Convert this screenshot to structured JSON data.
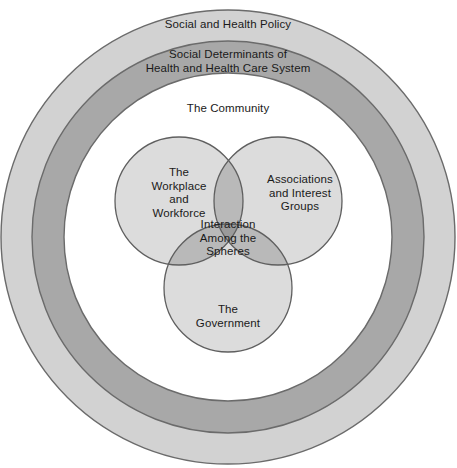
{
  "diagram": {
    "background_color": "#ffffff",
    "center": {
      "x": 228,
      "y": 237
    },
    "rings": [
      {
        "name": "outer-ring",
        "label": "Social and Health Policy",
        "outer_radius": 227,
        "inner_radius": 196,
        "fill": "#d2d2d2",
        "stroke": "#6b6b6b"
      },
      {
        "name": "middle-ring",
        "label": "Social Determinants of\nHealth and Health Care System",
        "outer_radius": 196,
        "inner_radius": 164,
        "fill": "#a8a8a8",
        "stroke": "#6b6b6b"
      },
      {
        "name": "inner-disc",
        "label": "The Community",
        "outer_radius": 164,
        "inner_radius": 0,
        "fill": "#ffffff",
        "stroke": "#6b6b6b"
      }
    ],
    "venn": {
      "radius": 64,
      "circle_fill": "#dcdcdc",
      "pair_overlap_fill": "#b9b9b9",
      "triple_overlap_fill": "#9a9a9a",
      "stroke": "#5f5f5f",
      "circles": [
        {
          "name": "workplace",
          "label": "The\nWorkplace\nand\nWorkforce",
          "cx": 179,
          "cy": 201
        },
        {
          "name": "associations",
          "label": "Associations\nand Interest\nGroups",
          "cx": 278,
          "cy": 201
        },
        {
          "name": "government",
          "label": "The\nGovernment",
          "cx": 228,
          "cy": 288
        }
      ],
      "intersection_label": "Interaction\nAmong the\nSpheres"
    }
  }
}
